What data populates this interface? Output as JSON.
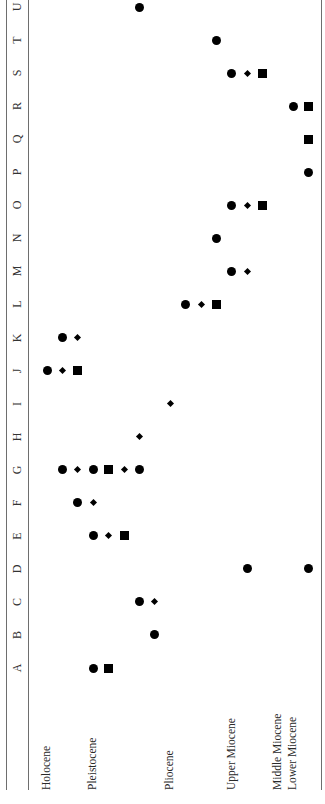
{
  "chart_data": {
    "type": "scatter",
    "orientation": "rotated-90-ccw",
    "title": "",
    "xlabel": "Epoch",
    "ylabel": "Taxon",
    "row_labels": [
      "A",
      "B",
      "C",
      "D",
      "E",
      "F",
      "G",
      "H",
      "I",
      "J",
      "K",
      "L",
      "M",
      "N",
      "O",
      "P",
      "Q",
      "R",
      "S",
      "T",
      "U"
    ],
    "epochs": [
      {
        "label": "Holocene",
        "slot": 0
      },
      {
        "label": "Pleistocene",
        "slot": 3
      },
      {
        "label": "Pliocene",
        "slot": 8
      },
      {
        "label": "Upper Miocene",
        "slot": 12
      },
      {
        "label": "Middle Miocene",
        "slot": 15
      },
      {
        "label": "Lower Miocene",
        "slot": 16
      }
    ],
    "marker_types": [
      "circle",
      "diamond",
      "square"
    ],
    "slot_count": 18,
    "rows": [
      {
        "label": "A",
        "markers": [
          {
            "slot": 3,
            "shape": "circle"
          },
          {
            "slot": 4,
            "shape": "square"
          }
        ]
      },
      {
        "label": "B",
        "markers": [
          {
            "slot": 7,
            "shape": "circle"
          }
        ]
      },
      {
        "label": "C",
        "markers": [
          {
            "slot": 6,
            "shape": "circle"
          },
          {
            "slot": 7,
            "shape": "diamond"
          }
        ]
      },
      {
        "label": "D",
        "markers": [
          {
            "slot": 13,
            "shape": "circle"
          },
          {
            "slot": 17,
            "shape": "circle"
          }
        ]
      },
      {
        "label": "E",
        "markers": [
          {
            "slot": 3,
            "shape": "circle"
          },
          {
            "slot": 4,
            "shape": "diamond"
          },
          {
            "slot": 5,
            "shape": "square"
          }
        ]
      },
      {
        "label": "F",
        "markers": [
          {
            "slot": 2,
            "shape": "circle"
          },
          {
            "slot": 3,
            "shape": "diamond"
          }
        ]
      },
      {
        "label": "G",
        "markers": [
          {
            "slot": 1,
            "shape": "circle"
          },
          {
            "slot": 2,
            "shape": "diamond"
          },
          {
            "slot": 3,
            "shape": "circle"
          },
          {
            "slot": 4,
            "shape": "square"
          },
          {
            "slot": 5,
            "shape": "diamond"
          },
          {
            "slot": 6,
            "shape": "circle"
          }
        ]
      },
      {
        "label": "H",
        "markers": [
          {
            "slot": 6,
            "shape": "diamond"
          }
        ]
      },
      {
        "label": "I",
        "markers": [
          {
            "slot": 8,
            "shape": "diamond"
          }
        ]
      },
      {
        "label": "J",
        "markers": [
          {
            "slot": 0,
            "shape": "circle"
          },
          {
            "slot": 1,
            "shape": "diamond"
          },
          {
            "slot": 2,
            "shape": "square"
          }
        ]
      },
      {
        "label": "K",
        "markers": [
          {
            "slot": 1,
            "shape": "circle"
          },
          {
            "slot": 2,
            "shape": "diamond"
          }
        ]
      },
      {
        "label": "L",
        "markers": [
          {
            "slot": 9,
            "shape": "circle"
          },
          {
            "slot": 10,
            "shape": "diamond"
          },
          {
            "slot": 11,
            "shape": "square"
          }
        ]
      },
      {
        "label": "M",
        "markers": [
          {
            "slot": 12,
            "shape": "circle"
          },
          {
            "slot": 13,
            "shape": "diamond"
          }
        ]
      },
      {
        "label": "N",
        "markers": [
          {
            "slot": 11,
            "shape": "circle"
          }
        ]
      },
      {
        "label": "O",
        "markers": [
          {
            "slot": 12,
            "shape": "circle"
          },
          {
            "slot": 13,
            "shape": "diamond"
          },
          {
            "slot": 14,
            "shape": "square"
          }
        ]
      },
      {
        "label": "P",
        "markers": [
          {
            "slot": 17,
            "shape": "circle"
          }
        ]
      },
      {
        "label": "Q",
        "markers": [
          {
            "slot": 17,
            "shape": "square"
          }
        ]
      },
      {
        "label": "R",
        "markers": [
          {
            "slot": 16,
            "shape": "circle"
          },
          {
            "slot": 17,
            "shape": "square"
          }
        ]
      },
      {
        "label": "S",
        "markers": [
          {
            "slot": 12,
            "shape": "circle"
          },
          {
            "slot": 13,
            "shape": "diamond"
          },
          {
            "slot": 14,
            "shape": "square"
          }
        ]
      },
      {
        "label": "T",
        "markers": [
          {
            "slot": 11,
            "shape": "circle"
          }
        ]
      },
      {
        "label": "U",
        "markers": [
          {
            "slot": 6,
            "shape": "circle"
          }
        ]
      }
    ],
    "grid": false,
    "legend": null
  },
  "colors": {
    "marker": "#000000",
    "rule": "#6e6e6e",
    "text": "#2a2a2a"
  }
}
